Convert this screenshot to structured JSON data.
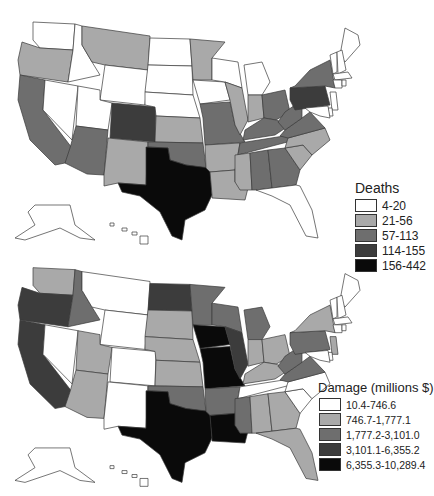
{
  "chart_data": [
    {
      "type": "choropleth",
      "title": "Deaths",
      "legend_position": "right-bottom",
      "bins": [
        {
          "label": "4-20",
          "color": "#ffffff"
        },
        {
          "label": "21-56",
          "color": "#a9a9a9"
        },
        {
          "label": "57-113",
          "color": "#6e6e6e"
        },
        {
          "label": "114-155",
          "color": "#3c3c3c"
        },
        {
          "label": "156-442",
          "color": "#0a0a0a"
        }
      ],
      "states": {
        "WA": 0,
        "OR": 1,
        "CA": 2,
        "NV": 0,
        "ID": 0,
        "MT": 1,
        "WY": 0,
        "UT": 0,
        "AZ": 2,
        "CO": 3,
        "NM": 1,
        "ND": 0,
        "SD": 0,
        "NE": 0,
        "KS": 1,
        "OK": 2,
        "TX": 4,
        "MN": 1,
        "IA": 0,
        "MO": 2,
        "AR": 1,
        "LA": 1,
        "WI": 0,
        "IL": 1,
        "MI": 0,
        "IN": 1,
        "OH": 2,
        "KY": 2,
        "TN": 2,
        "MS": 1,
        "AL": 2,
        "GA": 2,
        "FL": 0,
        "SC": 1,
        "NC": 1,
        "VA": 2,
        "WV": 2,
        "PA": 3,
        "NY": 2,
        "ME": 0,
        "VT": 0,
        "NH": 0,
        "MA": 0,
        "CT": 0,
        "RI": 0,
        "NJ": 0,
        "DE": 0,
        "MD": 0,
        "AK": 0,
        "HI": 0
      }
    },
    {
      "type": "choropleth",
      "title": "Damage (millions $)",
      "legend_position": "right-bottom",
      "bins": [
        {
          "label": "10.4-746.6",
          "color": "#ffffff"
        },
        {
          "label": "746.7-1,777.1",
          "color": "#a9a9a9"
        },
        {
          "label": "1,777.2-3,101.0",
          "color": "#6e6e6e"
        },
        {
          "label": "3,101.1-6,355.2",
          "color": "#3c3c3c"
        },
        {
          "label": "6,355.3-10,289.4",
          "color": "#0a0a0a"
        }
      ],
      "states": {
        "WA": 1,
        "OR": 3,
        "CA": 3,
        "NV": 0,
        "ID": 2,
        "MT": 0,
        "WY": 0,
        "UT": 1,
        "AZ": 1,
        "CO": 0,
        "NM": 0,
        "ND": 3,
        "SD": 1,
        "NE": 1,
        "KS": 1,
        "OK": 2,
        "TX": 4,
        "MN": 2,
        "IA": 4,
        "MO": 4,
        "AR": 2,
        "LA": 4,
        "WI": 2,
        "IL": 3,
        "MI": 2,
        "IN": 1,
        "OH": 1,
        "KY": 1,
        "TN": 0,
        "MS": 2,
        "AL": 1,
        "GA": 1,
        "FL": 1,
        "SC": 0,
        "NC": 0,
        "VA": 2,
        "WV": 2,
        "PA": 2,
        "NY": 1,
        "ME": 0,
        "VT": 0,
        "NH": 0,
        "MA": 0,
        "CT": 0,
        "RI": 0,
        "NJ": 1,
        "DE": 0,
        "MD": 0,
        "AK": 0,
        "HI": 0
      }
    }
  ]
}
